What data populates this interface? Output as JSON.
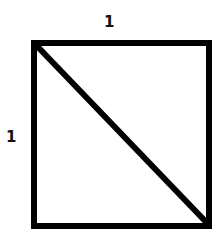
{
  "diagram": {
    "labels": {
      "top_side": "1",
      "left_side": "1"
    },
    "shape": {
      "type": "square",
      "x": 34,
      "y": 43,
      "width": 175,
      "height": 183,
      "stroke": "#000000",
      "stroke_width": 6,
      "fill": "#ffffff"
    },
    "diagonal": {
      "from": [
        36,
        45
      ],
      "to": [
        208,
        224
      ],
      "stroke": "#000000",
      "stroke_width": 6
    }
  }
}
